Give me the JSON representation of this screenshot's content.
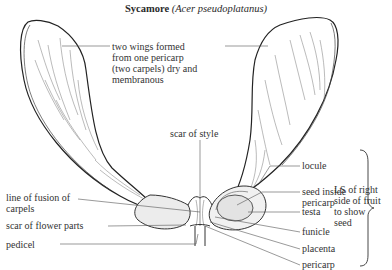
{
  "title": {
    "common_name": "Sycamore",
    "latin_name": "(Acer pseudoplatanus)"
  },
  "labels": {
    "wings": "two wings formed\nfrom one pericarp\n(two carpels) dry and\nmembranous",
    "scar_of_style": "scar of style",
    "line_of_fusion": "line of fusion of\ncarpels",
    "scar_of_flower_parts": "scar of flower parts",
    "pedicel": "pedicel",
    "locule": "locule",
    "seed_inside_pericarp": "seed inside\npericarp",
    "testa": "testa",
    "funicle": "funicle",
    "placenta": "placenta",
    "pericarp": "pericarp",
    "ls_note": "LS of right\nside of fruit\nto show\nseed"
  },
  "colors": {
    "line": "#333333",
    "fill_seed": "#e6e6e6",
    "fill_body": "#e9e9e9"
  }
}
